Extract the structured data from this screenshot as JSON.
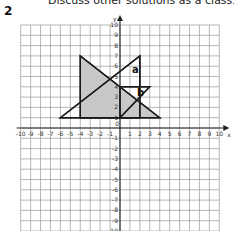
{
  "header": {
    "instruction_text": "Discuss other solutions as a class.",
    "question_number": "2"
  },
  "grid": {
    "x_min": -10,
    "x_max": 10,
    "y_min": -10,
    "y_max": 10,
    "origin_px": [
      120,
      128
    ],
    "cell_w": 9.93,
    "cell_h": 10.3,
    "x_axis_label": "x",
    "y_axis_label": "y",
    "origin_label": "0",
    "x_tick_labels": [
      "-10",
      "-9",
      "-8",
      "-7",
      "-6",
      "-5",
      "-4",
      "-3",
      "-2",
      "-1",
      "1",
      "2",
      "3",
      "4",
      "5",
      "6",
      "7",
      "8",
      "9",
      "10"
    ],
    "y_tick_labels": [
      "10",
      "9",
      "8",
      "7",
      "6",
      "5",
      "4",
      "3",
      "2",
      "1",
      "-1",
      "-2",
      "-3",
      "-4",
      "-5",
      "-6",
      "-7",
      "-8",
      "-9",
      "-10"
    ]
  },
  "shapes": [
    {
      "name": "shaded-triangle",
      "points": [
        [
          -4,
          7
        ],
        [
          -4,
          1
        ],
        [
          4,
          1
        ]
      ],
      "fill": "#c8c8c8",
      "label": ""
    },
    {
      "name": "triangle-a",
      "points": [
        [
          -6,
          1
        ],
        [
          2,
          7
        ],
        [
          2,
          1
        ]
      ],
      "fill": "none",
      "label": "a",
      "label_pos": [
        1.2,
        5.3
      ]
    },
    {
      "name": "triangle-b",
      "points": [
        [
          0,
          1
        ],
        [
          0,
          4
        ],
        [
          3,
          4
        ]
      ],
      "fill": "none",
      "label": "b",
      "label_pos": [
        1.7,
        3.1
      ]
    }
  ],
  "colors": {
    "grid_line": "#9a9a9a",
    "axis": "#222222",
    "shape_stroke": "#1a1a1a",
    "shade": "#c8c8c8"
  }
}
